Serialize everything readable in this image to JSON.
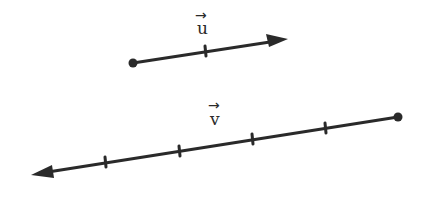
{
  "diagram": {
    "title": "",
    "vectors": [
      {
        "id": "u",
        "label": "u",
        "arrow_glyph": "→",
        "start": [
          133,
          63
        ],
        "end": [
          288,
          39
        ],
        "ticks": [
          [
            205,
            51
          ]
        ],
        "segments": 2,
        "label_pos": [
          196,
          21
        ],
        "arrow_pos": [
          195,
          8
        ]
      },
      {
        "id": "v",
        "label": "v",
        "arrow_glyph": "→",
        "start": [
          398,
          117
        ],
        "end": [
          31,
          175
        ],
        "ticks": [
          [
            325,
            128
          ],
          [
            252,
            139
          ],
          [
            179,
            151
          ],
          [
            105,
            162
          ]
        ],
        "segments": 5,
        "label_pos": [
          209,
          112
        ],
        "arrow_pos": [
          208,
          98
        ]
      }
    ],
    "relationship": "v = -(5/2) u",
    "colors": {
      "ink": "#2a2a2a",
      "background": "#ffffff"
    }
  }
}
